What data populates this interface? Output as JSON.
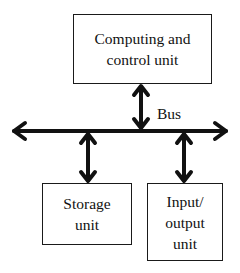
{
  "diagram": {
    "nodes": [
      {
        "id": "compute",
        "label": "Computing and\ncontrol unit"
      },
      {
        "id": "storage",
        "label": "Storage\nunit"
      },
      {
        "id": "io",
        "label": "Input/\noutput\nunit"
      }
    ],
    "bus_label": "Bus",
    "edges": [
      {
        "from": "compute",
        "to": "bus",
        "type": "bidirectional"
      },
      {
        "from": "storage",
        "to": "bus",
        "type": "bidirectional"
      },
      {
        "from": "io",
        "to": "bus",
        "type": "bidirectional"
      }
    ],
    "bus": {
      "direction": "horizontal",
      "arrowheads": "both-ends"
    },
    "colors": {
      "stroke": "#111111",
      "background": "#ffffff"
    }
  }
}
